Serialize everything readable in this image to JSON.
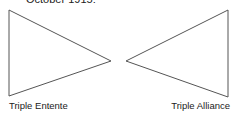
{
  "title": "October 1915:",
  "diagram": {
    "left_triangle": {
      "label": "Triple Entente",
      "points": "9,10 111,61 9,96"
    },
    "right_triangle": {
      "label": "Triple Alliance",
      "points": "126,61 228,10 228,97"
    },
    "stroke_color": "#555555"
  }
}
